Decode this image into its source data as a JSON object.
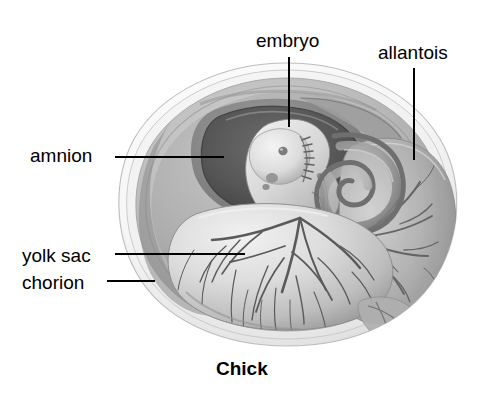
{
  "figure": {
    "title": "Chick",
    "style": "grayscale pencil/airbrush anatomical illustration",
    "width": 490,
    "height": 399,
    "background_color": "#ffffff"
  },
  "labels": {
    "embryo": "embryo",
    "allantois": "allantois",
    "amnion": "amnion",
    "yolk_sac": "yolk sac",
    "chorion": "chorion"
  },
  "caption": {
    "text": "Chick"
  },
  "colors": {
    "text": "#000000",
    "leader_line": "#000000",
    "shell_outer": "#e8e8e8",
    "shell_membrane": "#f2f2f2",
    "chorion_band": "#c9c9c9",
    "albumen": "#b4b4b4",
    "amnion_cavity": "#5a5a5a",
    "amnion_wall": "#8f8f8f",
    "embryo_body": "#d8d8d8",
    "yolk_sac": "#cfcfcf",
    "yolk_vessels": "#6e6e6e",
    "allantois": "#a6a6a6"
  },
  "leader_lines": [
    {
      "name": "embryo",
      "from": [
        289,
        57
      ],
      "to": [
        289,
        127
      ],
      "orientation": "vertical"
    },
    {
      "name": "allantois",
      "from": [
        414,
        68
      ],
      "to": [
        414,
        160
      ],
      "orientation": "vertical"
    },
    {
      "name": "amnion",
      "from": [
        115,
        157
      ],
      "to": [
        224,
        157
      ],
      "orientation": "horizontal"
    },
    {
      "name": "yolk_sac",
      "from": [
        115,
        254
      ],
      "to": [
        245,
        254
      ],
      "orientation": "horizontal"
    },
    {
      "name": "chorion",
      "from": [
        107,
        281
      ],
      "to": [
        155,
        281
      ],
      "orientation": "horizontal"
    }
  ],
  "egg_geometry": {
    "left": 114,
    "right": 458,
    "top": 63,
    "bottom": 346,
    "center": [
      287,
      205
    ]
  }
}
